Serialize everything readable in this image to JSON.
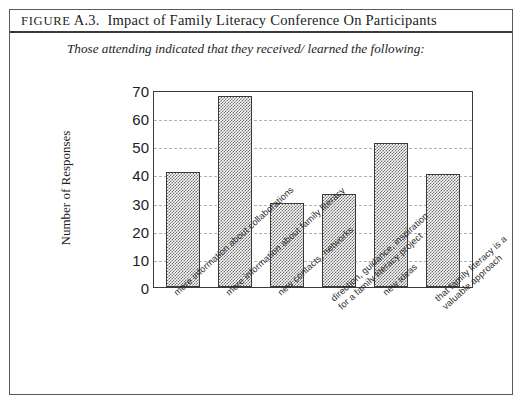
{
  "figure": {
    "label_prefix": "FIGURE",
    "label_number": "A.3.",
    "title_rest": "Impact of Family Literacy Conference On Participants",
    "title_full": "FIGURE A.3.  Impact of Family Literacy Conference On Participants",
    "subtitle": "Those attending indicated that they received/ learned the following:"
  },
  "chart_data": {
    "type": "bar",
    "title": "Impact of Family Literacy Conference On Participants",
    "subtitle": "Those attending indicated that they received/ learned the following:",
    "xlabel": "",
    "ylabel": "Number of Responses",
    "ylim": [
      0,
      70
    ],
    "yticks": [
      0,
      10,
      20,
      30,
      40,
      50,
      60,
      70
    ],
    "ytick_labels": [
      "0",
      "10",
      "20",
      "30",
      "40",
      "50",
      "60",
      "70"
    ],
    "gridlines": [
      10,
      20,
      30,
      40,
      50,
      60
    ],
    "grid": true,
    "legend": false,
    "bar_fill": "stippled-gray-checkerboard",
    "bar_edge_color": "#3a3a3a",
    "categories": [
      "more information about collaborations",
      "more information about family literacy",
      "new contacts, networks",
      "direction, guidance, inspiration for a family literacy project",
      "new ideas",
      "that family literacy is a valuable approach"
    ],
    "category_lines": [
      [
        "more information about collaborations"
      ],
      [
        "more information about family literacy"
      ],
      [
        "new contacts, networks"
      ],
      [
        "direction, guidance, inspiration",
        "for a family literacy project"
      ],
      [
        "new ideas"
      ],
      [
        "that family literacy is a",
        "valuable approach"
      ]
    ],
    "values": [
      41,
      68,
      30,
      33,
      51,
      40
    ]
  },
  "colors": {
    "frame": "#5a5a5a",
    "rule": "#3a3a3a",
    "grid": "#b4b4b4",
    "bar": "#6e6e6e",
    "text": "#1d1d1d",
    "background": "#ffffff"
  }
}
